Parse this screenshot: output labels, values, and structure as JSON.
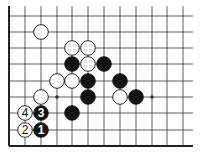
{
  "diagram": {
    "type": "go-board-fragment",
    "grid": {
      "cols_x": [
        9,
        25,
        41,
        57,
        72,
        88,
        104,
        120,
        136,
        152,
        167,
        183
      ],
      "rows_y": [
        16,
        32,
        48,
        64,
        81,
        97,
        113,
        130,
        146
      ],
      "top_y": 6,
      "right_x": 193,
      "left_edge_is_border": true,
      "bottom_edge_is_border": true
    },
    "star_points": [
      {
        "col": 3,
        "row": 5
      },
      {
        "col": 9,
        "row": 5
      }
    ],
    "stones": [
      {
        "color": "white",
        "col": 2,
        "row": 1,
        "label": ""
      },
      {
        "color": "white",
        "col": 4,
        "row": 2,
        "label": ""
      },
      {
        "color": "white",
        "col": 5,
        "row": 2,
        "label": ""
      },
      {
        "color": "black",
        "col": 4,
        "row": 3,
        "label": ""
      },
      {
        "color": "white",
        "col": 5,
        "row": 3,
        "label": ""
      },
      {
        "color": "black",
        "col": 6,
        "row": 3,
        "label": ""
      },
      {
        "color": "white",
        "col": 3,
        "row": 4,
        "label": ""
      },
      {
        "color": "white",
        "col": 4,
        "row": 4,
        "label": ""
      },
      {
        "color": "black",
        "col": 5,
        "row": 4,
        "label": ""
      },
      {
        "color": "black",
        "col": 7,
        "row": 4,
        "label": ""
      },
      {
        "color": "white",
        "col": 2,
        "row": 5,
        "label": ""
      },
      {
        "color": "black",
        "col": 5,
        "row": 5,
        "label": ""
      },
      {
        "color": "white",
        "col": 7,
        "row": 5,
        "label": ""
      },
      {
        "color": "black",
        "col": 8,
        "row": 5,
        "label": ""
      },
      {
        "color": "white",
        "col": 1,
        "row": 6,
        "label": "4"
      },
      {
        "color": "black",
        "col": 2,
        "row": 6,
        "label": "3"
      },
      {
        "color": "black",
        "col": 4,
        "row": 6,
        "label": ""
      },
      {
        "color": "white",
        "col": 1,
        "row": 7,
        "label": "2"
      },
      {
        "color": "black",
        "col": 2,
        "row": 7,
        "label": "1"
      }
    ],
    "colors": {
      "line": "#333333",
      "border": "#222222",
      "black_stone": "#111111",
      "white_stone": "#ffffff",
      "background": "#ffffff"
    }
  }
}
